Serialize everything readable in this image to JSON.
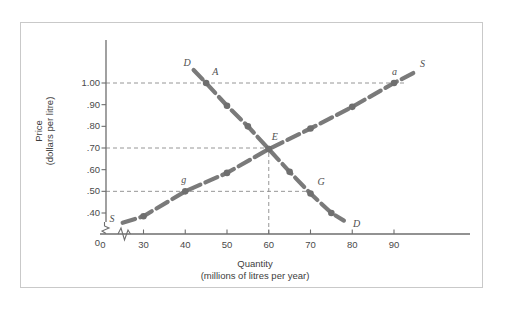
{
  "figure": {
    "background_color": "#ffffff",
    "frame_color": "#c9c9c9",
    "curve_color": "#7a7a7a",
    "axis_color": "#6e6e6e",
    "text_color": "#4a4a4a"
  },
  "chart_data": {
    "type": "line",
    "title": "",
    "xlabel_line1": "Quantity",
    "xlabel_line2": "(millions of litres per year)",
    "ylabel_line1": "Price",
    "ylabel_line2": "(dollars per litre)",
    "xlim": [
      20,
      97
    ],
    "ylim": [
      0.33,
      1.08
    ],
    "grid": false,
    "axis_break_x": true,
    "axis_break_y": true,
    "xticks": [
      {
        "value": 0,
        "label": "0"
      },
      {
        "value": 30,
        "label": "30"
      },
      {
        "value": 40,
        "label": "40"
      },
      {
        "value": 50,
        "label": "50"
      },
      {
        "value": 60,
        "label": "60"
      },
      {
        "value": 70,
        "label": "70"
      },
      {
        "value": 80,
        "label": "80"
      },
      {
        "value": 90,
        "label": "90"
      }
    ],
    "yticks": [
      {
        "value": 1.0,
        "label": "1.00"
      },
      {
        "value": 0.9,
        "label": ".90"
      },
      {
        "value": 0.8,
        "label": ".80"
      },
      {
        "value": 0.7,
        "label": ".70"
      },
      {
        "value": 0.6,
        "label": ".60"
      },
      {
        "value": 0.5,
        "label": ".50"
      },
      {
        "value": 0.4,
        "label": ".40"
      },
      {
        "value": 0.33,
        "label": "0"
      }
    ],
    "series": [
      {
        "name": "Supply",
        "curve_label": "S",
        "label_positions": [
          "start",
          "end"
        ],
        "x": [
          25,
          30,
          40,
          50,
          60,
          70,
          80,
          90,
          95
        ],
        "y": [
          0.355,
          0.385,
          0.5,
          0.585,
          0.695,
          0.79,
          0.89,
          1.0,
          1.05
        ],
        "markers_x": [
          30,
          40,
          50,
          60,
          70,
          80,
          90
        ],
        "markers_y": [
          0.385,
          0.5,
          0.585,
          0.695,
          0.79,
          0.89,
          1.0
        ]
      },
      {
        "name": "Demand",
        "curve_label": "D",
        "label_positions": [
          "start",
          "end"
        ],
        "x": [
          42,
          45,
          50,
          55,
          60,
          65,
          70,
          75,
          78
        ],
        "y": [
          1.06,
          1.0,
          0.895,
          0.8,
          0.695,
          0.59,
          0.49,
          0.4,
          0.365
        ],
        "markers_x": [
          45,
          50,
          55,
          60,
          65,
          70,
          75
        ],
        "markers_y": [
          1.0,
          0.895,
          0.8,
          0.695,
          0.59,
          0.49,
          0.4
        ]
      }
    ],
    "annotations": [
      {
        "id": "A",
        "label": "A",
        "x": 45,
        "y": 1.0,
        "desc": "demand quantity at $1.00"
      },
      {
        "id": "a",
        "label": "a",
        "x": 90,
        "y": 1.0,
        "desc": "supply quantity at $1.00"
      },
      {
        "id": "E",
        "label": "E",
        "x": 60,
        "y": 0.7,
        "desc": "equilibrium"
      },
      {
        "id": "g",
        "label": "g",
        "x": 40,
        "y": 0.5,
        "desc": "supply quantity at $0.50"
      },
      {
        "id": "G",
        "label": "G",
        "x": 70,
        "y": 0.5,
        "desc": "demand quantity at $0.50"
      },
      {
        "id": "D-top",
        "label": "D",
        "x": 42,
        "y": 1.06,
        "desc": "demand curve label upper"
      },
      {
        "id": "D-bottom",
        "label": "D",
        "x": 78.5,
        "y": 0.365,
        "desc": "demand curve label lower"
      },
      {
        "id": "S-top",
        "label": "S",
        "x": 95.5,
        "y": 1.05,
        "desc": "supply curve label upper"
      },
      {
        "id": "S-bottom",
        "label": "S",
        "x": 24,
        "y": 0.36,
        "desc": "supply curve label lower"
      }
    ],
    "guide_lines": [
      {
        "type": "horizontal",
        "y": 1.0,
        "from_x": 20,
        "to_x": 93,
        "style": "dashed"
      },
      {
        "type": "horizontal",
        "y": 0.7,
        "from_x": 20,
        "to_x": 60,
        "style": "dashed"
      },
      {
        "type": "horizontal",
        "y": 0.5,
        "from_x": 20,
        "to_x": 70,
        "style": "dashed"
      },
      {
        "type": "vertical",
        "x": 60,
        "from_y": 0.33,
        "to_y": 0.7,
        "style": "dashed"
      }
    ]
  }
}
